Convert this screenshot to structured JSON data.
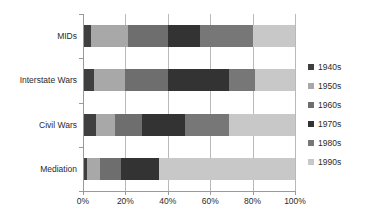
{
  "chart_data": {
    "type": "bar",
    "subtype": "stacked-bar-horizontal-100pct",
    "title": "",
    "xlabel": "",
    "ylabel": "",
    "orientation": "horizontal",
    "stacked": true,
    "normalized": true,
    "grid": true,
    "legend_position": "right",
    "xlim": [
      0,
      100
    ],
    "xticks": [
      0,
      20,
      40,
      60,
      80,
      100
    ],
    "xtick_labels": [
      "0%",
      "20%",
      "40%",
      "60%",
      "80%",
      "100%"
    ],
    "categories": [
      "MIDs",
      "Interstate Wars",
      "Civil Wars",
      "Mediation"
    ],
    "series": [
      {
        "name": "1940s",
        "color": "#3f3f3f",
        "values": [
          4,
          5,
          6,
          2
        ]
      },
      {
        "name": "1950s",
        "color": "#a8a8a8",
        "values": [
          17,
          15,
          9,
          6
        ]
      },
      {
        "name": "1960s",
        "color": "#6e6e6e",
        "values": [
          19,
          20,
          13,
          10
        ]
      },
      {
        "name": "1970s",
        "color": "#333333",
        "values": [
          15,
          29,
          20,
          18
        ]
      },
      {
        "name": "1980s",
        "color": "#777777",
        "values": [
          25,
          12,
          21,
          0
        ]
      },
      {
        "name": "1990s",
        "color": "#c8c8c8",
        "values": [
          20,
          19,
          31,
          64
        ]
      }
    ]
  },
  "legend": {
    "items": [
      {
        "label": "1940s",
        "color": "#3f3f3f"
      },
      {
        "label": "1950s",
        "color": "#a8a8a8"
      },
      {
        "label": "1960s",
        "color": "#6e6e6e"
      },
      {
        "label": "1970s",
        "color": "#333333"
      },
      {
        "label": "1980s",
        "color": "#777777"
      },
      {
        "label": "1990s",
        "color": "#c8c8c8"
      }
    ]
  },
  "axis": {
    "x_tick_labels": [
      "0%",
      "20%",
      "40%",
      "60%",
      "80%",
      "100%"
    ],
    "category_labels": [
      "MIDs",
      "Interstate Wars",
      "Civil Wars",
      "Mediation"
    ]
  }
}
